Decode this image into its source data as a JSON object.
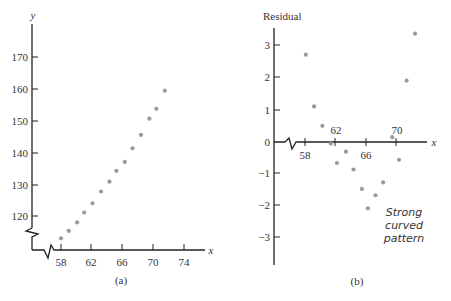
{
  "chart_data": [
    {
      "type": "scatter",
      "panel": "(a)",
      "title": "",
      "xlabel": "x",
      "ylabel": "y",
      "x_ticks": [
        58,
        62,
        66,
        70,
        74
      ],
      "y_ticks": [
        120,
        130,
        140,
        150,
        160,
        170
      ],
      "xlim": [
        54.5,
        76.5
      ],
      "ylim": [
        109,
        180
      ],
      "axis_breaks": [
        "x",
        "y"
      ],
      "grid": false,
      "points": [
        {
          "x": 58.0,
          "y": 113.0
        },
        {
          "x": 59.0,
          "y": 115.3
        },
        {
          "x": 60.1,
          "y": 118.0
        },
        {
          "x": 61.0,
          "y": 121.1
        },
        {
          "x": 62.1,
          "y": 124.0
        },
        {
          "x": 63.2,
          "y": 127.7
        },
        {
          "x": 64.3,
          "y": 130.8
        },
        {
          "x": 65.2,
          "y": 134.2
        },
        {
          "x": 66.3,
          "y": 137.0
        },
        {
          "x": 67.3,
          "y": 141.3
        },
        {
          "x": 68.4,
          "y": 145.5
        },
        {
          "x": 69.5,
          "y": 150.6
        },
        {
          "x": 70.4,
          "y": 153.7
        },
        {
          "x": 71.5,
          "y": 159.4
        }
      ]
    },
    {
      "type": "scatter",
      "panel": "(b)",
      "title": "",
      "xlabel": "x",
      "ylabel": "Residual",
      "x_ticks": [
        58,
        62,
        66,
        70
      ],
      "y_ticks": [
        3,
        2,
        1,
        0,
        -1,
        -2,
        -3
      ],
      "xlim": [
        54,
        76
      ],
      "ylim": [
        -3.8,
        3.6
      ],
      "axis_breaks": [
        "x"
      ],
      "grid": false,
      "annotation": "Strong curved pattern",
      "points": [
        {
          "x": 58.1,
          "y": 2.7
        },
        {
          "x": 59.2,
          "y": 1.1
        },
        {
          "x": 60.3,
          "y": 0.5
        },
        {
          "x": 61.4,
          "y": -0.05
        },
        {
          "x": 62.2,
          "y": -0.65
        },
        {
          "x": 63.4,
          "y": -0.3
        },
        {
          "x": 64.4,
          "y": -0.85
        },
        {
          "x": 65.5,
          "y": -1.45
        },
        {
          "x": 66.3,
          "y": -2.05
        },
        {
          "x": 67.3,
          "y": -1.65
        },
        {
          "x": 68.3,
          "y": -1.25
        },
        {
          "x": 69.5,
          "y": 0.15
        },
        {
          "x": 70.4,
          "y": -0.55
        },
        {
          "x": 71.4,
          "y": 1.9
        },
        {
          "x": 72.5,
          "y": 3.35
        }
      ]
    }
  ],
  "panel_a": {
    "y_axis_label": "y",
    "x_axis_label": "x",
    "y_tick_labels": [
      "170",
      "160",
      "150",
      "140",
      "130",
      "120"
    ],
    "x_tick_labels": [
      "58",
      "62",
      "66",
      "70",
      "74"
    ],
    "caption": "(a)"
  },
  "panel_b": {
    "y_axis_label": "Residual",
    "x_axis_label": "x",
    "y_tick_labels": [
      "3",
      "2",
      "1",
      "0",
      "−1",
      "−2",
      "−3"
    ],
    "x_tick_labels": [
      "58",
      "62",
      "66",
      "70"
    ],
    "caption": "(b)",
    "annotation_lines": [
      "Strong",
      "curved",
      "pattern"
    ]
  },
  "colors": {
    "axis": "#222222",
    "point": "#9a9a9a",
    "text": "#333333"
  }
}
